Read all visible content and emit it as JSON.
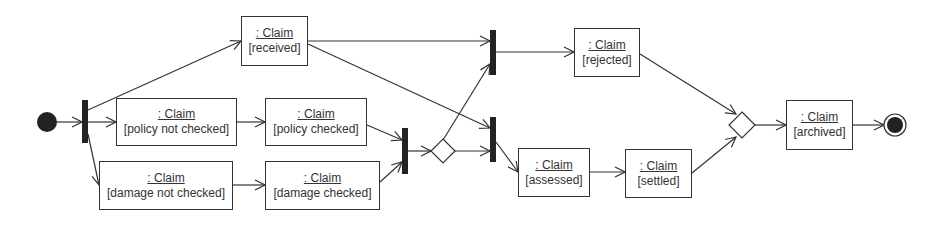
{
  "diagram": {
    "type": "UML activity diagram (object flow)",
    "nodes": [
      {
        "id": "received",
        "object": ": Claim",
        "state": "[received]"
      },
      {
        "id": "policy_not_checked",
        "object": ": Claim",
        "state": "[policy not checked]"
      },
      {
        "id": "damage_not_checked",
        "object": ": Claim",
        "state": "[damage not checked]"
      },
      {
        "id": "policy_checked",
        "object": ": Claim",
        "state": "[policy checked]"
      },
      {
        "id": "damage_checked",
        "object": ": Claim",
        "state": "[damage checked]"
      },
      {
        "id": "rejected",
        "object": ": Claim",
        "state": "[rejected]"
      },
      {
        "id": "assessed",
        "object": ": Claim",
        "state": "[assessed]"
      },
      {
        "id": "settled",
        "object": ": Claim",
        "state": "[settled]"
      },
      {
        "id": "archived",
        "object": ": Claim",
        "state": "[archived]"
      }
    ]
  },
  "colors": {
    "line": "#333333",
    "fill": "#222222",
    "background": "#ffffff"
  }
}
